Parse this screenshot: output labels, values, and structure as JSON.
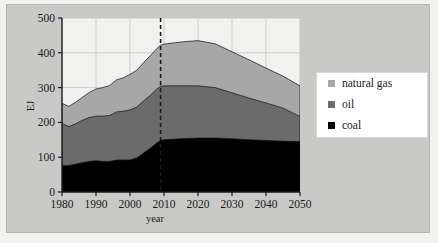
{
  "chart_data": {
    "type": "area",
    "stacked": true,
    "title": "",
    "xlabel": "year",
    "ylabel": "EJ",
    "xlim": [
      1980,
      2050
    ],
    "ylim": [
      0,
      500
    ],
    "xticks": [
      1980,
      1990,
      2000,
      2010,
      2020,
      2030,
      2040,
      2050
    ],
    "yticks": [
      0,
      100,
      200,
      300,
      400,
      500
    ],
    "grid": true,
    "legend_position": "right",
    "annotations": [
      {
        "type": "vertical-dashed-line",
        "x": 2009,
        "label": ""
      }
    ],
    "x": [
      1980,
      1982,
      1984,
      1986,
      1988,
      1990,
      1992,
      1994,
      1996,
      1998,
      2000,
      2002,
      2004,
      2006,
      2008,
      2009,
      2010,
      2015,
      2020,
      2025,
      2030,
      2035,
      2040,
      2045,
      2050
    ],
    "series": [
      {
        "name": "coal",
        "color": "#000000",
        "values": [
          75,
          76,
          80,
          84,
          88,
          90,
          88,
          88,
          92,
          92,
          92,
          98,
          112,
          126,
          142,
          148,
          150,
          153,
          155,
          155,
          153,
          150,
          148,
          146,
          145
        ]
      },
      {
        "name": "oil",
        "color": "#6b6b6b",
        "values": [
          122,
          112,
          116,
          122,
          126,
          128,
          130,
          132,
          138,
          140,
          144,
          146,
          150,
          152,
          155,
          156,
          155,
          152,
          150,
          145,
          132,
          120,
          108,
          95,
          72
        ]
      },
      {
        "name": "natural gas",
        "color": "#a7a7a7",
        "values": [
          58,
          58,
          62,
          66,
          72,
          78,
          82,
          86,
          92,
          96,
          102,
          106,
          110,
          114,
          116,
          118,
          120,
          126,
          130,
          126,
          118,
          110,
          100,
          92,
          88
        ]
      }
    ],
    "totals": [
      255,
      246,
      258,
      272,
      286,
      296,
      300,
      306,
      322,
      328,
      338,
      350,
      372,
      392,
      413,
      422,
      425,
      431,
      435,
      426,
      403,
      380,
      356,
      333,
      305
    ]
  },
  "legend": {
    "items": [
      {
        "label": "natural gas",
        "color": "#a7a7a7"
      },
      {
        "label": "oil",
        "color": "#6b6b6b"
      },
      {
        "label": "coal",
        "color": "#000000"
      }
    ]
  },
  "axes": {
    "y_title": "EJ",
    "x_title": "year",
    "y_tick_labels": [
      "500",
      "400",
      "300",
      "200",
      "100",
      "0"
    ],
    "x_tick_labels": [
      "1980",
      "1990",
      "2000",
      "2010",
      "2020",
      "2030",
      "2040",
      "2050"
    ]
  }
}
